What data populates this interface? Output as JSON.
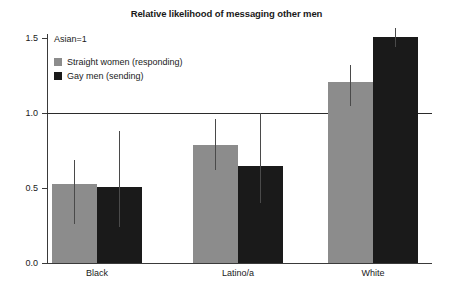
{
  "chart_data": {
    "type": "bar",
    "title": "Relative likelihood of messaging other men",
    "xlabel": "",
    "ylabel": "",
    "categories": [
      "Black",
      "Latino/a",
      "White"
    ],
    "ylim": [
      0.0,
      1.5
    ],
    "yticks": [
      "0.0",
      "0.5",
      "1.0",
      "1.5"
    ],
    "ytick_values": [
      0.0,
      0.5,
      1.0,
      1.5
    ],
    "grid": false,
    "reference_line": 1.0,
    "annotation": "Asian=1",
    "legend_position": "top-left",
    "series": [
      {
        "name": "Straight women (responding)",
        "color": "#8c8c8c",
        "values": [
          0.53,
          0.79,
          1.21
        ],
        "error_low": [
          0.26,
          0.62,
          1.05
        ],
        "error_high": [
          0.69,
          0.96,
          1.32
        ]
      },
      {
        "name": "Gay men (sending)",
        "color": "#1a1a1a",
        "values": [
          0.51,
          0.65,
          1.51
        ],
        "error_low": [
          0.24,
          0.4,
          1.44
        ],
        "error_high": [
          0.88,
          1.0,
          1.57
        ]
      }
    ]
  },
  "axis": {
    "tick_0": "0.0",
    "tick_1": "0.5",
    "tick_2": "1.0",
    "tick_3": "1.5"
  },
  "colors": {
    "series_light": "#8c8c8c",
    "series_dark": "#1a1a1a",
    "axis": "#3a3a3a",
    "background": "#ffffff"
  }
}
